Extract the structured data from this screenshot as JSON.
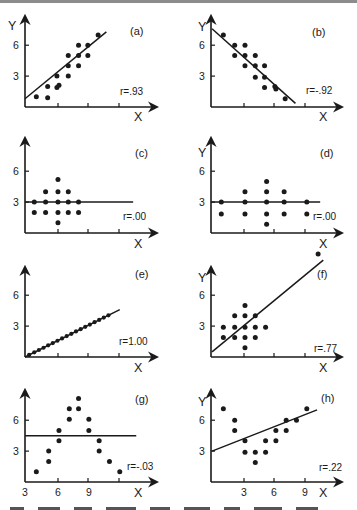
{
  "figure": {
    "scale_px_per_unit": 10.3
  },
  "chart_data": [
    {
      "type": "scatter",
      "panel": "a",
      "label": "(a)",
      "annotation": "r=.93",
      "xlabel": "X",
      "ylabel": "Y",
      "yticks": [
        3,
        6
      ],
      "xticks_labeled": false,
      "origin": [
        25,
        107
      ],
      "yaxis_top": 16,
      "xaxis_right": 157,
      "tick_px": [
        33,
        63,
        94
      ],
      "points": [
        [
          1.1,
          1.0
        ],
        [
          2.2,
          0.9
        ],
        [
          2.2,
          2.0
        ],
        [
          3.1,
          1.9
        ],
        [
          3.3,
          2.1
        ],
        [
          3.1,
          3.0
        ],
        [
          4.2,
          3.0
        ],
        [
          4.2,
          4.0
        ],
        [
          4.2,
          5.0
        ],
        [
          5.2,
          4.0
        ],
        [
          5.2,
          5.0
        ],
        [
          5.2,
          6.0
        ],
        [
          6.1,
          5.0
        ],
        [
          6.1,
          6.0
        ],
        [
          7.1,
          7.0
        ]
      ],
      "fit_line": [
        [
          0,
          0.8
        ],
        [
          7.9,
          7.3
        ]
      ],
      "text_pos": {
        "label": [
          130,
          35
        ],
        "r": [
          120,
          95
        ],
        "ylabel": [
          8,
          30
        ],
        "xlabel": [
          134,
          121
        ]
      }
    },
    {
      "type": "scatter",
      "panel": "b",
      "label": "(b)",
      "annotation": "r=-.92",
      "xlabel": "X",
      "ylabel": "Y",
      "yticks": [
        3,
        6
      ],
      "xticks_labeled": false,
      "origin": [
        211,
        107
      ],
      "yaxis_top": 16,
      "xaxis_right": 342,
      "tick_px": [
        33,
        63,
        94
      ],
      "points": [
        [
          1.2,
          7.0
        ],
        [
          2.3,
          6.0
        ],
        [
          3.3,
          6.0
        ],
        [
          2.3,
          5.0
        ],
        [
          3.3,
          5.0
        ],
        [
          4.3,
          5.0
        ],
        [
          3.3,
          4.0
        ],
        [
          4.3,
          4.0
        ],
        [
          5.2,
          4.0
        ],
        [
          4.3,
          2.9
        ],
        [
          5.2,
          2.9
        ],
        [
          5.2,
          1.9
        ],
        [
          6.2,
          2.0
        ],
        [
          6.3,
          1.75
        ],
        [
          7.2,
          0.8
        ]
      ],
      "fit_line": [
        [
          0.1,
          7.6
        ],
        [
          8.2,
          0.35
        ]
      ],
      "text_pos": {
        "label": [
          312,
          36
        ],
        "r": [
          306,
          94
        ],
        "ylabel": [
          198,
          31
        ],
        "xlabel": [
          319,
          121
        ]
      }
    },
    {
      "type": "scatter",
      "panel": "c",
      "label": "(c)",
      "annotation": "r=.00",
      "xlabel": "X",
      "ylabel": "",
      "yticks": [
        3,
        6
      ],
      "xticks_labeled": false,
      "origin": [
        25,
        233
      ],
      "yaxis_top": 138,
      "xaxis_right": 157,
      "tick_px": [
        33,
        63,
        94
      ],
      "points": [
        [
          0.9,
          3.0
        ],
        [
          2.0,
          3.0
        ],
        [
          3.2,
          3.0
        ],
        [
          4.2,
          3.0
        ],
        [
          5.2,
          3.0
        ],
        [
          0.9,
          2.0
        ],
        [
          2.0,
          2.0
        ],
        [
          3.2,
          2.0
        ],
        [
          4.2,
          2.0
        ],
        [
          5.2,
          2.0
        ],
        [
          2.0,
          4.0
        ],
        [
          3.2,
          4.0
        ],
        [
          4.2,
          4.0
        ],
        [
          3.2,
          5.2
        ],
        [
          3.2,
          1.0
        ]
      ],
      "fit_line": [
        [
          0,
          3.0
        ],
        [
          10.5,
          3.0
        ]
      ],
      "text_pos": {
        "label": [
          135,
          157
        ],
        "r": [
          123,
          220
        ],
        "ylabel": [
          0,
          0
        ],
        "xlabel": [
          134,
          248
        ]
      }
    },
    {
      "type": "scatter",
      "panel": "d",
      "label": "(d)",
      "annotation": "r=.00",
      "xlabel": "X",
      "ylabel": "Y",
      "yticks": [
        3,
        6
      ],
      "xticks_labeled": false,
      "origin": [
        211,
        233
      ],
      "yaxis_top": 138,
      "xaxis_right": 342,
      "tick_px": [
        33,
        63,
        94
      ],
      "points": [
        [
          1.0,
          3.0
        ],
        [
          3.3,
          3.0
        ],
        [
          5.4,
          3.0
        ],
        [
          7.1,
          3.0
        ],
        [
          9.3,
          3.0
        ],
        [
          1.0,
          1.85
        ],
        [
          3.3,
          1.85
        ],
        [
          5.4,
          1.85
        ],
        [
          7.1,
          1.85
        ],
        [
          9.3,
          1.85
        ],
        [
          3.3,
          4.0
        ],
        [
          5.4,
          4.0
        ],
        [
          7.1,
          4.0
        ],
        [
          5.4,
          5.0
        ],
        [
          5.4,
          0.85
        ]
      ],
      "fit_line": [
        [
          0,
          3.0
        ],
        [
          10.6,
          3.0
        ]
      ],
      "text_pos": {
        "label": [
          320,
          157
        ],
        "r": [
          313,
          220
        ],
        "ylabel": [
          198,
          157
        ],
        "xlabel": [
          319,
          248
        ]
      }
    },
    {
      "type": "scatter",
      "panel": "e",
      "label": "(e)",
      "annotation": "r=1.00",
      "xlabel": "X",
      "ylabel": "",
      "yticks": [
        3,
        6
      ],
      "xticks_labeled": false,
      "origin": [
        25,
        357
      ],
      "yaxis_top": 267,
      "xaxis_right": 157,
      "tick_px": [
        33,
        63,
        94
      ],
      "points": [
        [
          0.4,
          0.2
        ],
        [
          0.9,
          0.45
        ],
        [
          1.35,
          0.68
        ],
        [
          1.8,
          0.9
        ],
        [
          2.25,
          1.13
        ],
        [
          2.7,
          1.35
        ],
        [
          3.15,
          1.58
        ],
        [
          3.6,
          1.8
        ],
        [
          4.05,
          2.03
        ],
        [
          4.5,
          2.25
        ],
        [
          4.95,
          2.48
        ],
        [
          5.4,
          2.7
        ],
        [
          5.85,
          2.93
        ],
        [
          6.3,
          3.15
        ],
        [
          6.75,
          3.38
        ],
        [
          7.2,
          3.6
        ],
        [
          7.65,
          3.83
        ],
        [
          8.1,
          4.05
        ]
      ],
      "fit_line": [
        [
          0,
          0
        ],
        [
          9.2,
          4.6
        ]
      ],
      "text_pos": {
        "label": [
          135,
          278
        ],
        "r": [
          119,
          345
        ],
        "ylabel": [
          0,
          0
        ],
        "xlabel": [
          134,
          372
        ]
      }
    },
    {
      "type": "scatter",
      "panel": "f",
      "label": "(f)",
      "annotation": "r=.77",
      "xlabel": "X",
      "ylabel": "Y",
      "yticks": [
        3,
        6
      ],
      "xticks_labeled": false,
      "origin": [
        211,
        357
      ],
      "yaxis_top": 267,
      "xaxis_right": 342,
      "tick_px": [
        33,
        63,
        94
      ],
      "points": [
        [
          1.2,
          2.9
        ],
        [
          2.3,
          2.9
        ],
        [
          3.3,
          2.9
        ],
        [
          4.3,
          2.9
        ],
        [
          5.3,
          2.9
        ],
        [
          1.2,
          1.9
        ],
        [
          2.3,
          1.9
        ],
        [
          3.3,
          1.9
        ],
        [
          4.3,
          1.9
        ],
        [
          2.3,
          4.0
        ],
        [
          3.3,
          4.0
        ],
        [
          4.3,
          4.0
        ],
        [
          3.3,
          5.0
        ],
        [
          3.3,
          0.9
        ],
        [
          10.4,
          10.0
        ]
      ],
      "fit_line": [
        [
          0.1,
          0.5
        ],
        [
          10.9,
          9.4
        ]
      ],
      "text_pos": {
        "label": [
          317,
          278
        ],
        "r": [
          314,
          352
        ],
        "ylabel": [
          198,
          282
        ],
        "xlabel": [
          319,
          372
        ]
      }
    },
    {
      "type": "scatter",
      "panel": "g",
      "label": "(g)",
      "annotation": "r=-.03",
      "xlabel": "X",
      "ylabel": "",
      "yticks": [
        3,
        6
      ],
      "xticks_labeled": true,
      "xtick_labels": [
        "3",
        "6",
        "9"
      ],
      "xtick_label_px": [
        0,
        33,
        64
      ],
      "origin": [
        25,
        482
      ],
      "yaxis_top": 390,
      "xaxis_right": 157,
      "tick_px": [
        33,
        63,
        94
      ],
      "x_actual": [
        4,
        5,
        5,
        6,
        6,
        7,
        7,
        8,
        8,
        9,
        9,
        10,
        10,
        11,
        12
      ],
      "points": [
        [
          1.1,
          1.0
        ],
        [
          2.3,
          2.0
        ],
        [
          2.3,
          3.0
        ],
        [
          3.3,
          4.0
        ],
        [
          3.3,
          5.0
        ],
        [
          4.3,
          6.1
        ],
        [
          4.3,
          7.1
        ],
        [
          5.2,
          8.1
        ],
        [
          5.2,
          7.1
        ],
        [
          6.2,
          6.1
        ],
        [
          6.2,
          5.0
        ],
        [
          7.2,
          4.0
        ],
        [
          7.2,
          3.0
        ],
        [
          8.2,
          2.0
        ],
        [
          9.2,
          1.0
        ]
      ],
      "fit_line": [
        [
          0,
          4.5
        ],
        [
          10.8,
          4.5
        ]
      ],
      "text_pos": {
        "label": [
          135,
          403
        ],
        "r": [
          127,
          470
        ],
        "ylabel": [
          0,
          0
        ],
        "xlabel": [
          134,
          497
        ]
      }
    },
    {
      "type": "scatter",
      "panel": "h",
      "label": "(h)",
      "annotation": "r=.22",
      "xlabel": "X",
      "ylabel": "Y",
      "yticks": [
        3,
        6
      ],
      "xticks_labeled": true,
      "xtick_labels": [
        "3",
        "6",
        "9"
      ],
      "xtick_label_px": [
        33,
        63,
        94
      ],
      "origin": [
        211,
        482
      ],
      "yaxis_top": 390,
      "xaxis_right": 342,
      "tick_px": [
        33,
        63,
        94
      ],
      "x_actual": [
        1,
        2,
        2,
        3,
        3,
        4,
        4,
        5,
        5,
        6,
        6,
        7,
        7,
        8,
        9
      ],
      "points": [
        [
          1.2,
          7.1
        ],
        [
          2.3,
          6.0
        ],
        [
          2.3,
          5.0
        ],
        [
          3.3,
          4.0
        ],
        [
          3.3,
          2.9
        ],
        [
          4.3,
          2.9
        ],
        [
          4.3,
          1.9
        ],
        [
          5.3,
          4.0
        ],
        [
          5.3,
          2.9
        ],
        [
          6.3,
          5.0
        ],
        [
          6.3,
          4.0
        ],
        [
          7.3,
          6.0
        ],
        [
          7.3,
          5.0
        ],
        [
          8.3,
          6.0
        ],
        [
          9.3,
          7.1
        ]
      ],
      "fit_line": [
        [
          0.1,
          3.0
        ],
        [
          10.3,
          7.0
        ]
      ],
      "text_pos": {
        "label": [
          321,
          402
        ],
        "r": [
          319,
          471
        ],
        "ylabel": [
          198,
          406
        ],
        "xlabel": [
          319,
          497
        ]
      }
    }
  ],
  "colors": {
    "ink": "#1a1a1a",
    "background": "#ffffff",
    "top_strip": "#8c8c8c"
  }
}
